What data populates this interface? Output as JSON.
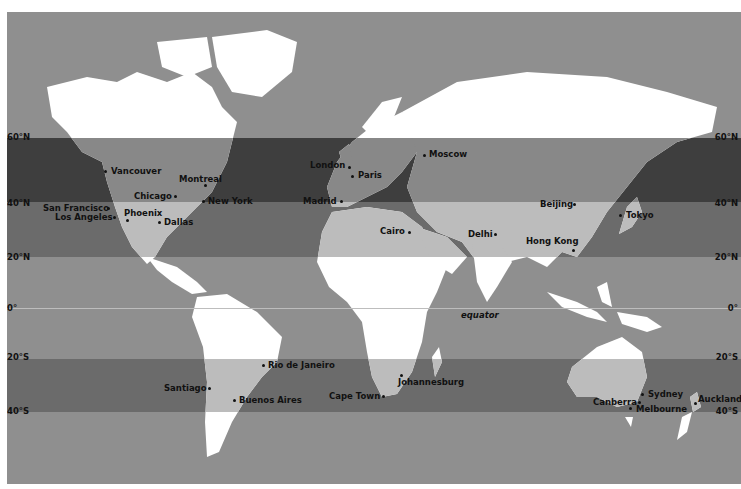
{
  "map": {
    "type": "world map with latitude bands",
    "colors": {
      "ocean": "#8f8f8f",
      "land": "#ffffff",
      "band_dark": "#3a3a3a",
      "band_mid": "#6a6a6a",
      "land_band_dark": "#7d7d7d",
      "land_band_mid": "#b8b8b8"
    },
    "latitude_labels": {
      "left": [
        "60°N",
        "40°N",
        "20°N",
        "0°",
        "20°S",
        "40°S"
      ],
      "right": [
        "60°N",
        "40°N",
        "20°N",
        "0°",
        "20°S",
        "40°S"
      ]
    },
    "equator_label": "equator",
    "cities": [
      {
        "name": "Vancouver"
      },
      {
        "name": "Montreal"
      },
      {
        "name": "Chicago"
      },
      {
        "name": "New York"
      },
      {
        "name": "San Francisco"
      },
      {
        "name": "Los Angeles"
      },
      {
        "name": "Phoenix"
      },
      {
        "name": "Dallas"
      },
      {
        "name": "London"
      },
      {
        "name": "Paris"
      },
      {
        "name": "Madrid"
      },
      {
        "name": "Moscow"
      },
      {
        "name": "Cairo"
      },
      {
        "name": "Delhi"
      },
      {
        "name": "Beijing"
      },
      {
        "name": "Tokyo"
      },
      {
        "name": "Hong Kong"
      },
      {
        "name": "Rio de Janeiro"
      },
      {
        "name": "Santiago"
      },
      {
        "name": "Buenos Aires"
      },
      {
        "name": "Johannesburg"
      },
      {
        "name": "Cape Town"
      },
      {
        "name": "Sydney"
      },
      {
        "name": "Canberra"
      },
      {
        "name": "Melbourne"
      },
      {
        "name": "Auckland"
      }
    ]
  }
}
